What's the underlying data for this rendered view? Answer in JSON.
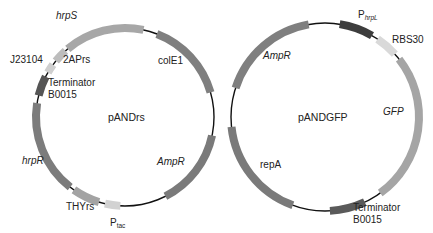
{
  "plasmids": [
    {
      "name": "pANDrs",
      "center": [
        125,
        117
      ],
      "radius": 89,
      "segments": [
        {
          "label": "hrpS",
          "start": 320,
          "end": 12,
          "color": "#a7a7a7",
          "italic": true
        },
        {
          "label": "colE1",
          "start": 21,
          "end": 74,
          "color": "#7f7f7f",
          "italic": false
        },
        {
          "label": "AmpR",
          "start": 102,
          "end": 153,
          "color": "#7a7a7a",
          "italic": true
        },
        {
          "label": "Ptac",
          "start": 183,
          "end": 193,
          "color": "#d2d2d2",
          "italic": false
        },
        {
          "label": "THYrs",
          "start": 197,
          "end": 215,
          "color": "#a3a3a3",
          "italic": false
        },
        {
          "label": "hrpR",
          "start": 218,
          "end": 279,
          "color": "#7c7c7c",
          "italic": true
        },
        {
          "label": "Terminator B0015",
          "start": 284,
          "end": 297,
          "color": "#555555",
          "italic": false
        },
        {
          "label": "J23104",
          "start": 300,
          "end": 306,
          "color": "#cfcfcf",
          "italic": false
        },
        {
          "label": "2APrs",
          "start": 309,
          "end": 318,
          "color": "#bdbdbd",
          "italic": false
        }
      ]
    },
    {
      "name": "pANDGFP",
      "center": [
        325,
        117
      ],
      "radius": 94,
      "segments": [
        {
          "label": "AmpR",
          "start": 288,
          "end": 350,
          "color": "#7f7f7f",
          "italic": true
        },
        {
          "label": "PhrpL",
          "start": 9,
          "end": 30,
          "color": "#3d3d3d",
          "italic": false
        },
        {
          "label": "RBS30",
          "start": 34,
          "end": 48,
          "color": "#d9d9d9",
          "italic": false
        },
        {
          "label": "GFP",
          "start": 52,
          "end": 144,
          "color": "#a5a5a5",
          "italic": true
        },
        {
          "label": "Terminator B0015",
          "start": 155,
          "end": 177,
          "color": "#5a5a5a",
          "italic": false
        },
        {
          "label": "repA",
          "start": 200,
          "end": 264,
          "color": "#7a7a7a",
          "italic": false
        }
      ]
    }
  ],
  "labels": {
    "left_center": "pANDrs",
    "left_hrpS": "hrpS",
    "left_2APrs": "2APrs",
    "left_J23104": "J23104",
    "left_term1": "Terminator",
    "left_term2": "B0015",
    "left_colE1": "colE1",
    "left_AmpR": "AmpR",
    "left_hrpR": "hrpR",
    "left_THYrs": "THYrs",
    "left_Ptac_P": "P",
    "left_Ptac_sub": "tac",
    "right_center": "pANDGFP",
    "right_AmpR": "AmpR",
    "right_PhrpL_P": "P",
    "right_PhrpL_sub": "hrpL",
    "right_RBS30": "RBS30",
    "right_GFP": "GFP",
    "right_repA": "repA",
    "right_term1": "Terminator",
    "right_term2": "B0015"
  },
  "colors": {
    "backbone": "#111111",
    "text": "#222222",
    "background": "#ffffff"
  }
}
